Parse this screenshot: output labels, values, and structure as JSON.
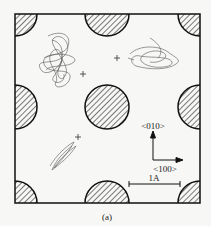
{
  "figure": {
    "caption": "(a)",
    "direction_labels": {
      "y_axis": "<010>",
      "x_axis": "<100>"
    },
    "scale_bar": {
      "label": "1A"
    },
    "colors": {
      "line": "#111111",
      "background": "#f7f7f5",
      "trace": "#555555"
    }
  }
}
